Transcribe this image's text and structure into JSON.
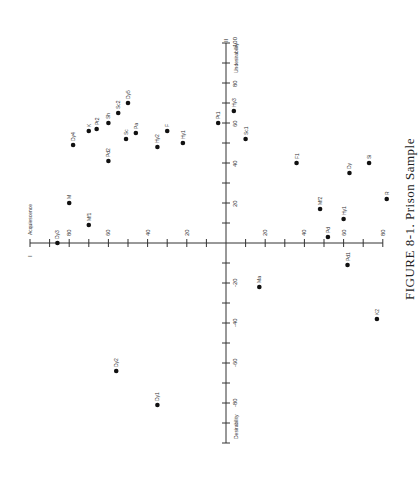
{
  "chart_data": {
    "type": "scatter",
    "title": "FIGURE 8-1.  Prison Sample",
    "orientation": "rotated 90 degrees",
    "axes": {
      "horizontal": {
        "label_left": "I  Acquiescence",
        "ticks_left": [
          100,
          80,
          60,
          40,
          20
        ],
        "ticks_right": [
          20,
          40,
          60,
          80
        ],
        "range": [
          -100,
          80
        ]
      },
      "vertical": {
        "label_top": "II  Undesirability",
        "label_bottom": "Desirability",
        "ticks": [
          100,
          80,
          60,
          40,
          20,
          -20,
          -40,
          -60,
          -80
        ],
        "range": [
          -100,
          100
        ]
      }
    },
    "points": [
      {
        "label": "Dy3",
        "x": -86,
        "y": 0
      },
      {
        "label": "Mb",
        "x": -80,
        "y": 20
      },
      {
        "label": "Mf1",
        "x": -70,
        "y": 9
      },
      {
        "label": "Dy4",
        "x": -78,
        "y": 49
      },
      {
        "label": "K",
        "x": -70,
        "y": 56
      },
      {
        "label": "Pt2",
        "x": -66,
        "y": 57
      },
      {
        "label": "Pd2",
        "x": -60,
        "y": 41
      },
      {
        "label": "Sh",
        "x": -60,
        "y": 60
      },
      {
        "label": "Sc2",
        "x": -55,
        "y": 65
      },
      {
        "label": "Dy5",
        "x": -50,
        "y": 70
      },
      {
        "label": "Sc",
        "x": -51,
        "y": 52
      },
      {
        "label": "Pa",
        "x": -46,
        "y": 55
      },
      {
        "label": "Hy2",
        "x": -35,
        "y": 48
      },
      {
        "label": "F",
        "x": -30,
        "y": 56
      },
      {
        "label": "Hy1",
        "x": -22,
        "y": 50
      },
      {
        "label": "Pt1",
        "x": -4,
        "y": 60
      },
      {
        "label": "Hy3",
        "x": 4,
        "y": 66
      },
      {
        "label": "Sc1",
        "x": 10,
        "y": 52
      },
      {
        "label": "F1",
        "x": 36,
        "y": 40
      },
      {
        "label": "Dy",
        "x": 63,
        "y": 35
      },
      {
        "label": "Si",
        "x": 73,
        "y": 40
      },
      {
        "label": "R",
        "x": 82,
        "y": 22
      },
      {
        "label": "Mf2",
        "x": 48,
        "y": 17
      },
      {
        "label": "Hy1b",
        "x": 60,
        "y": 12
      },
      {
        "label": "Pd",
        "x": 52,
        "y": 3
      },
      {
        "label": "Pd1",
        "x": 62,
        "y": -11
      },
      {
        "label": "Ma",
        "x": 17,
        "y": -22
      },
      {
        "label": "K2",
        "x": 77,
        "y": -38
      },
      {
        "label": "Dy2",
        "x": -56,
        "y": -64
      },
      {
        "label": "Dy1",
        "x": -35,
        "y": -81
      }
    ]
  }
}
